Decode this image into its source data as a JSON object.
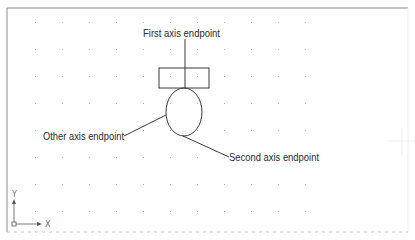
{
  "drawing": {
    "labels": {
      "first_axis": "First axis endpoint",
      "other_axis": "Other axis endpoint",
      "second_axis": "Second axis endpoint"
    },
    "ucs_icon": {
      "x_label": "X",
      "y_label": "Y"
    },
    "grid": {
      "columns": 11,
      "rows": 8,
      "spacing_px": 27
    },
    "colors": {
      "background": "#ffffff",
      "line": "#3a3a3a",
      "grid_dot": "#b0b0b0",
      "border": "#8a8a8a"
    }
  }
}
